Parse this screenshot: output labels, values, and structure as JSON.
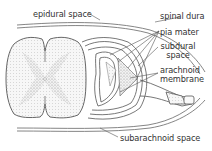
{
  "diagram": {
    "colors": {
      "line": "#555555",
      "text": "#333333",
      "gray_matter_stipple": "#9a9a9a",
      "white_matter": "#eeeeee",
      "background": "#ffffff"
    },
    "labels": {
      "epidural_space": "epidural space",
      "spinal_dura": "spinal dura",
      "pia_mater": "pia mater",
      "subdural_line1": "subdural",
      "subdural_line2": "space",
      "arachnoid_line1": "arachnoid",
      "arachnoid_line2": "membrane",
      "subarachnoid_space": "subarachnoid space"
    }
  }
}
